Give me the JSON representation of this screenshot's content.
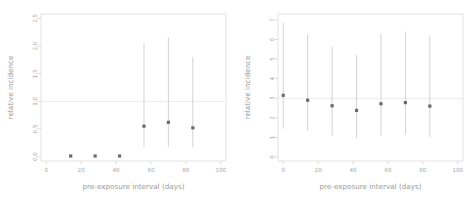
{
  "figure": {
    "width": 473,
    "height": 203,
    "background": "#ffffff",
    "marker_color": "#6b6b6b",
    "errorbar_color": "#c4c4c4",
    "frame_color": "#d8d8d8",
    "refline_color": "#e2e2e2",
    "label_color": "#9a9a9a"
  },
  "chart_data": [
    {
      "type": "scatter",
      "panel": "left",
      "title": "",
      "xlabel": "pre-exposure interval (days)",
      "ylabel": "relative incidence",
      "xlim": [
        -3,
        103
      ],
      "ylim": [
        -0.08,
        2.58
      ],
      "xticks": [
        0,
        20,
        40,
        60,
        80,
        100
      ],
      "xticklabels": [
        "0",
        "20",
        "40",
        "60",
        "80",
        "100"
      ],
      "yticks": [
        0.0,
        0.5,
        1.0,
        1.5,
        2.0,
        2.5
      ],
      "yticklabels": [
        "0.0",
        "0.5",
        "1.0",
        "1.5",
        "2.0",
        "2.5"
      ],
      "grid": false,
      "legend": "none",
      "reference_line": 1.0,
      "x": [
        14,
        28,
        42,
        56,
        70,
        84
      ],
      "values": [
        0.01,
        0.01,
        0.01,
        0.55,
        0.62,
        0.52
      ],
      "ci_low": [
        0.0,
        0.0,
        0.0,
        0.17,
        0.17,
        0.17
      ],
      "ci_high": [
        0.02,
        0.02,
        0.02,
        2.05,
        2.15,
        1.8
      ]
    },
    {
      "type": "scatter",
      "panel": "right",
      "title": "",
      "xlabel": "pre-exposure interval (days)",
      "ylabel": "relative incidence",
      "xlim": [
        -3,
        103
      ],
      "ylim": [
        -0.2,
        7.3
      ],
      "xticks": [
        0,
        20,
        40,
        60,
        80,
        100
      ],
      "xticklabels": [
        "0",
        "20",
        "40",
        "60",
        "80",
        "100"
      ],
      "yticks": [
        0,
        1,
        2,
        3,
        4,
        5,
        6,
        7
      ],
      "yticklabels": [
        "0",
        "1",
        "2",
        "3",
        "4",
        "5",
        "6",
        "7"
      ],
      "grid": false,
      "legend": "none",
      "reference_line": 3.0,
      "x": [
        0,
        14,
        28,
        42,
        56,
        70,
        84
      ],
      "values": [
        3.15,
        2.9,
        2.62,
        2.38,
        2.72,
        2.78,
        2.6
      ],
      "ci_low": [
        1.45,
        1.35,
        1.1,
        0.98,
        1.1,
        1.15,
        1.02
      ],
      "ci_high": [
        6.85,
        6.25,
        5.65,
        5.2,
        6.3,
        6.4,
        6.2
      ]
    }
  ]
}
